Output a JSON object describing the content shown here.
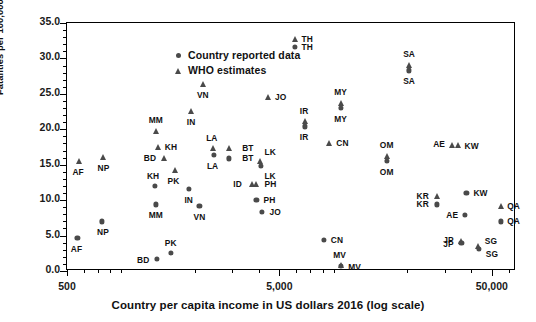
{
  "chart_data": {
    "type": "scatter",
    "title": "",
    "xlabel": "Country per capita income in US dollars 2016 (log scale)",
    "ylabel": "Fatalities per 100,000 persons",
    "xscale": "log",
    "xlim": [
      500,
      65000
    ],
    "ylim": [
      0.0,
      35.0
    ],
    "grid": false,
    "legend_position": "top-left",
    "ytick_labels": [
      "0.0",
      "5.0",
      "10.0",
      "15.0",
      "20.0",
      "25.0",
      "30.0",
      "35.0"
    ],
    "ytick_values": [
      0.0,
      5.0,
      10.0,
      15.0,
      20.0,
      25.0,
      30.0,
      35.0
    ],
    "xtick_labels": [
      "500",
      "5,000",
      "50,000"
    ],
    "xtick_values": [
      500,
      5000,
      50000
    ],
    "series": [
      {
        "name": "Country reported data",
        "marker": "circle",
        "color": "#4a4a4a",
        "points": [
          {
            "label": "AF",
            "x": 560,
            "y": 4.7,
            "lx": -1,
            "ly": 11
          },
          {
            "label": "NP",
            "x": 730,
            "y": 7.0,
            "lx": 1,
            "ly": 11
          },
          {
            "label": "BD",
            "x": 1330,
            "y": 1.7,
            "lx": -14,
            "ly": 1
          },
          {
            "label": "PK",
            "x": 1540,
            "y": 2.6,
            "lx": 0,
            "ly": -10
          },
          {
            "label": "MM",
            "x": 1310,
            "y": 9.4,
            "lx": 0,
            "ly": 11
          },
          {
            "label": "KH",
            "x": 1300,
            "y": 12.0,
            "lx": -2,
            "ly": -10
          },
          {
            "label": "IN",
            "x": 1870,
            "y": 11.6,
            "lx": 0,
            "ly": 11
          },
          {
            "label": "VN",
            "x": 2100,
            "y": 9.2,
            "lx": 0,
            "ly": 11
          },
          {
            "label": "LA",
            "x": 2450,
            "y": 16.4,
            "lx": -1,
            "ly": 11
          },
          {
            "label": "BT",
            "x": 2890,
            "y": 15.9,
            "lx": 19,
            "ly": 0
          },
          {
            "label": "LK",
            "x": 4100,
            "y": 14.8,
            "lx": 9,
            "ly": 10
          },
          {
            "label": "PH",
            "x": 3900,
            "y": 10.0,
            "lx": 13,
            "ly": 0
          },
          {
            "label": "JO",
            "x": 4150,
            "y": 8.3,
            "lx": 13,
            "ly": 0
          },
          {
            "label": "TH",
            "x": 5930,
            "y": 31.6,
            "lx": 12,
            "ly": 0
          },
          {
            "label": "IR",
            "x": 6600,
            "y": 20.4,
            "lx": -1,
            "ly": 11
          },
          {
            "label": "MY",
            "x": 9700,
            "y": 23.0,
            "lx": 0,
            "ly": 11
          },
          {
            "label": "CN",
            "x": 8100,
            "y": 4.4,
            "lx": 13,
            "ly": 0
          },
          {
            "label": "MV",
            "x": 9700,
            "y": 0.7,
            "lx": 14,
            "ly": 1
          },
          {
            "label": "SA",
            "x": 20400,
            "y": 28.3,
            "lx": 0,
            "ly": 11
          },
          {
            "label": "OM",
            "x": 16000,
            "y": 15.5,
            "lx": 0,
            "ly": 11
          },
          {
            "label": "KR",
            "x": 27500,
            "y": 9.4,
            "lx": -14,
            "ly": 0
          },
          {
            "label": "KW",
            "x": 38000,
            "y": 11.0,
            "lx": 14,
            "ly": 0
          },
          {
            "label": "AE",
            "x": 37500,
            "y": 7.9,
            "lx": -13,
            "ly": 0
          },
          {
            "label": "QA",
            "x": 55000,
            "y": 7.0,
            "lx": 13,
            "ly": 0
          },
          {
            "label": "JP",
            "x": 36000,
            "y": 4.0,
            "lx": -13,
            "ly": 1
          },
          {
            "label": "SG",
            "x": 43500,
            "y": 3.1,
            "lx": 13,
            "ly": 5
          }
        ]
      },
      {
        "name": "WHO estimates",
        "marker": "triangle",
        "color": "#4a4a4a",
        "points": [
          {
            "label": "AF",
            "x": 570,
            "y": 15.5,
            "lx": -1,
            "ly": 11
          },
          {
            "label": "NP",
            "x": 735,
            "y": 16.1,
            "lx": 1,
            "ly": 11
          },
          {
            "label": "MM",
            "x": 1310,
            "y": 19.8,
            "lx": 0,
            "ly": -11
          },
          {
            "label": "KH",
            "x": 1340,
            "y": 17.5,
            "lx": 13,
            "ly": 0
          },
          {
            "label": "BD",
            "x": 1430,
            "y": 15.9,
            "lx": -14,
            "ly": 0
          },
          {
            "label": "PK",
            "x": 1620,
            "y": 14.3,
            "lx": -2,
            "ly": 11
          },
          {
            "label": "IN",
            "x": 1920,
            "y": 22.6,
            "lx": 0,
            "ly": 11
          },
          {
            "label": "VN",
            "x": 2180,
            "y": 26.4,
            "lx": 0,
            "ly": 11
          },
          {
            "label": "LA",
            "x": 2430,
            "y": 17.3,
            "lx": -1,
            "ly": -10
          },
          {
            "label": "BT",
            "x": 2890,
            "y": 17.3,
            "lx": 19,
            "ly": 0
          },
          {
            "label": "LK",
            "x": 4060,
            "y": 15.5,
            "lx": 10,
            "ly": -9
          },
          {
            "label": "ID",
            "x": 3700,
            "y": 12.3,
            "lx": -14,
            "ly": 0
          },
          {
            "label": "PH",
            "x": 3900,
            "y": 12.3,
            "lx": 14,
            "ly": 0
          },
          {
            "label": "JO",
            "x": 4400,
            "y": 24.5,
            "lx": 13,
            "ly": 0
          },
          {
            "label": "TH",
            "x": 5930,
            "y": 32.8,
            "lx": 12,
            "ly": 0
          },
          {
            "label": "IR",
            "x": 6600,
            "y": 21.1,
            "lx": -1,
            "ly": -10
          },
          {
            "label": "MY",
            "x": 9700,
            "y": 23.7,
            "lx": 0,
            "ly": -11
          },
          {
            "label": "CN",
            "x": 8600,
            "y": 18.0,
            "lx": 13,
            "ly": 0
          },
          {
            "label": "MV",
            "x": 9700,
            "y": 0.8,
            "lx": -1,
            "ly": -10
          },
          {
            "label": "SA",
            "x": 20400,
            "y": 29.1,
            "lx": 0,
            "ly": -11
          },
          {
            "label": "OM",
            "x": 16000,
            "y": 16.3,
            "lx": 0,
            "ly": -11
          },
          {
            "label": "AE",
            "x": 32500,
            "y": 17.8,
            "lx": -13,
            "ly": -1
          },
          {
            "label": "KW",
            "x": 34500,
            "y": 17.8,
            "lx": 14,
            "ly": 1
          },
          {
            "label": "KR",
            "x": 27500,
            "y": 10.6,
            "lx": -14,
            "ly": 0
          },
          {
            "label": "QA",
            "x": 55000,
            "y": 9.2,
            "lx": 13,
            "ly": 0
          },
          {
            "label": "JP",
            "x": 36000,
            "y": 4.3,
            "lx": -13,
            "ly": -1
          },
          {
            "label": "SG",
            "x": 43000,
            "y": 3.5,
            "lx": 13,
            "ly": -5
          }
        ]
      }
    ]
  },
  "legend": {
    "items": [
      {
        "marker": "circle-marker",
        "label": "Country reported data"
      },
      {
        "marker": "triangle-marker",
        "label": "WHO estimates"
      }
    ]
  },
  "axes": {
    "y_title": "Fatalities per 100,000 persons",
    "x_title": "Country per capita income in US dollars 2016 (log scale)"
  }
}
